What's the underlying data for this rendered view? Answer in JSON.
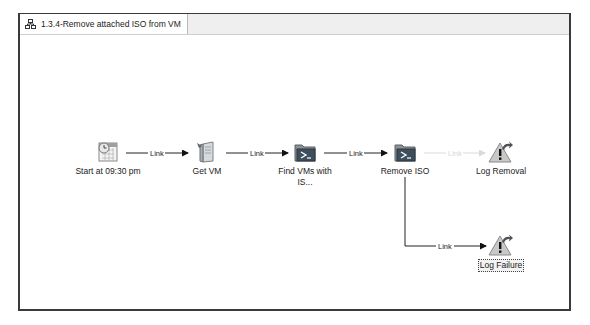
{
  "tab": {
    "title": "1.3.4-Remove attached ISO from VM",
    "icon": "runbook-icon"
  },
  "nodes": [
    {
      "id": "start",
      "label": "Start at 09:30 pm",
      "icon": "schedule-calendar-icon"
    },
    {
      "id": "getvm",
      "label": "Get VM",
      "icon": "server-icon"
    },
    {
      "id": "findvms",
      "label": "Find VMs with IS...",
      "icon": "powershell-folder-icon"
    },
    {
      "id": "removeiso",
      "label": "Remove ISO",
      "icon": "powershell-folder-icon"
    },
    {
      "id": "logremoval",
      "label": "Log Removal",
      "icon": "warning-log-icon"
    },
    {
      "id": "logfailure",
      "label": "Log Failure",
      "icon": "warning-log-icon",
      "selected": true
    }
  ],
  "links": [
    {
      "from": "start",
      "to": "getvm",
      "label": "Link",
      "enabled": true
    },
    {
      "from": "getvm",
      "to": "findvms",
      "label": "Link",
      "enabled": true
    },
    {
      "from": "findvms",
      "to": "removeiso",
      "label": "Link",
      "enabled": true
    },
    {
      "from": "removeiso",
      "to": "logremoval",
      "label": "Link",
      "enabled": false
    },
    {
      "from": "removeiso",
      "to": "logfailure",
      "label": "Link",
      "enabled": true
    }
  ]
}
